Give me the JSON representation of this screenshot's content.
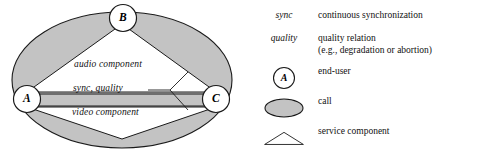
{
  "diagram": {
    "nodes": [
      {
        "id": "a",
        "label": "A"
      },
      {
        "id": "b",
        "label": "B"
      },
      {
        "id": "c",
        "label": "C"
      }
    ],
    "component_labels": {
      "audio": "audio component",
      "sync_quality": "sync, quality",
      "video": "video component"
    }
  },
  "legend": {
    "rows": [
      {
        "symbol_kind": "italic-text",
        "symbol_text": "sync",
        "text_line1": "continuous synchronization",
        "text_line2": ""
      },
      {
        "symbol_kind": "italic-text",
        "symbol_text": "quality",
        "text_line1": "quality relation",
        "text_line2": "(e.g., degradation or abortion)"
      },
      {
        "symbol_kind": "circle-node",
        "symbol_text": "A",
        "text_line1": "end-user",
        "text_line2": ""
      },
      {
        "symbol_kind": "filled-ellipse",
        "symbol_text": "",
        "text_line1": "call",
        "text_line2": ""
      },
      {
        "symbol_kind": "triangle",
        "symbol_text": "",
        "text_line1": "service component",
        "text_line2": ""
      }
    ]
  },
  "colors": {
    "call_fill": "#c3c3c3",
    "stroke": "#1a1a1a",
    "node_fill": "#ffffff",
    "component_fill": "#ffffff",
    "background": "#ffffff"
  }
}
